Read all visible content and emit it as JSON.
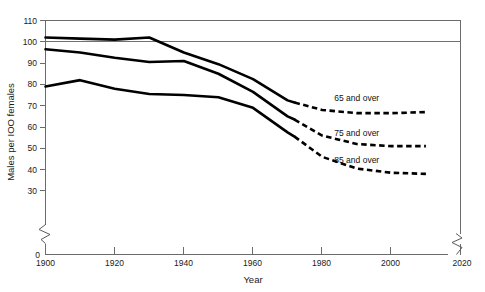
{
  "chart_data": {
    "type": "line",
    "title": "",
    "xlabel": "Year",
    "ylabel": "Males per IOO females",
    "xlim": [
      1900,
      2020
    ],
    "ylim": [
      0,
      110
    ],
    "y_axis_break": true,
    "y_break_between": [
      0,
      30
    ],
    "x_axis_break_right": true,
    "grid": false,
    "reference_line": {
      "value": 100,
      "orientation": "horizontal"
    },
    "yticks": [
      110,
      100,
      90,
      80,
      70,
      60,
      50,
      40,
      30,
      0
    ],
    "yticklabels": [
      "110",
      "100",
      "90",
      "80",
      "70",
      "60",
      "50",
      "40",
      "30",
      "0"
    ],
    "xticks": [
      1900,
      1920,
      1940,
      1960,
      1980,
      2000,
      2020
    ],
    "xticklabels": [
      "1900",
      "1920",
      "1940",
      "1960",
      "1980",
      "2000",
      "2020"
    ],
    "projection_starts_at": 1972,
    "series": [
      {
        "name": "65 and over",
        "label": "65 and over",
        "label_x": 1990,
        "label_y": 72,
        "x": [
          1900,
          1910,
          1920,
          1930,
          1940,
          1950,
          1960,
          1970,
          1972,
          1980,
          1990,
          2000,
          2010
        ],
        "values": [
          102,
          101.5,
          101,
          102,
          95,
          89.5,
          82.5,
          72.5,
          71.5,
          68,
          66.5,
          66.5,
          67
        ]
      },
      {
        "name": "75 and over",
        "label": "75 and over",
        "label_x": 1990,
        "label_y": 56,
        "x": [
          1900,
          1910,
          1920,
          1930,
          1940,
          1950,
          1960,
          1970,
          1972,
          1980,
          1990,
          2000,
          2010
        ],
        "values": [
          96.5,
          95,
          92.5,
          90.5,
          91,
          85,
          76.5,
          65,
          63.5,
          56,
          52,
          51,
          51
        ]
      },
      {
        "name": "85 and over",
        "label": "85 and over",
        "label_x": 1990,
        "label_y": 43,
        "x": [
          1900,
          1910,
          1920,
          1930,
          1940,
          1950,
          1960,
          1970,
          1972,
          1980,
          1990,
          2000,
          2010
        ],
        "values": [
          79,
          82,
          78,
          75.5,
          75,
          74,
          69,
          57.5,
          55.5,
          46,
          40.5,
          38.5,
          38
        ]
      }
    ]
  }
}
